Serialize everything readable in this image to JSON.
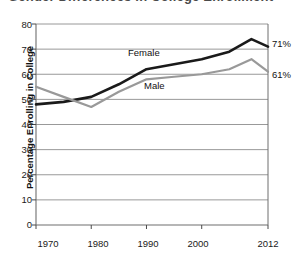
{
  "title_remnant": "Gender Differences in College Enrollment",
  "chart_data": {
    "type": "line",
    "title": "",
    "xlabel": "",
    "ylabel": "Percentage Enrolling in College",
    "xlim": [
      1970,
      2012
    ],
    "ylim": [
      0,
      80
    ],
    "ytick_values": [
      0,
      10,
      20,
      30,
      40,
      50,
      60,
      70,
      80
    ],
    "ytick_labels": [
      "0",
      "10",
      "20",
      "30",
      "40",
      "50",
      "60",
      "70",
      "80"
    ],
    "xtick_values": [
      1970,
      1980,
      1990,
      2000,
      2012
    ],
    "xtick_labels": [
      "1970",
      "1980",
      "1990",
      "2000",
      "2012"
    ],
    "grid": "horizontal",
    "legend_position": "inline-annotation",
    "series": [
      {
        "name": "Female",
        "color": "#1a1a1a",
        "label_text": "Female",
        "end_label": "71%",
        "end_value": 71,
        "x": [
          1970,
          1975,
          1980,
          1985,
          1990,
          1995,
          2000,
          2005,
          2009,
          2012
        ],
        "values": [
          48,
          49,
          51,
          56,
          62,
          64,
          66,
          69,
          74,
          71
        ]
      },
      {
        "name": "Male",
        "color": "#999999",
        "label_text": "Male",
        "end_label": "61%",
        "end_value": 61,
        "x": [
          1970,
          1975,
          1980,
          1985,
          1990,
          1995,
          2000,
          2005,
          2009,
          2012
        ],
        "values": [
          55,
          51,
          47,
          53,
          58,
          59,
          60,
          62,
          66,
          61
        ]
      }
    ],
    "annotations": [
      {
        "text": "Female",
        "series": "Female"
      },
      {
        "text": "Male",
        "series": "Male"
      }
    ]
  }
}
